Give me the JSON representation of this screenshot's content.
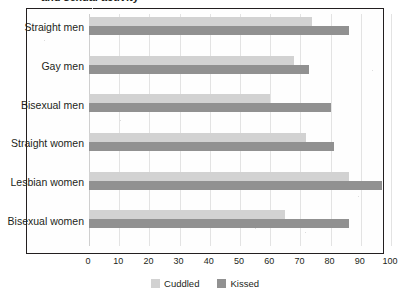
{
  "title": {
    "text": "and sexual activity",
    "cut_off": true
  },
  "legend": {
    "position": "bottom-center",
    "items": [
      {
        "label": "Cuddled",
        "color": "#d2d2d2",
        "swatch": "legend-swatch-cuddled"
      },
      {
        "label": "Kissed",
        "color": "#919191",
        "swatch": "legend-swatch-kissed"
      }
    ]
  },
  "axis": {
    "x_ticks": [
      "0",
      "10",
      "20",
      "30",
      "40",
      "50",
      "60",
      "70",
      "80",
      "90",
      "100"
    ],
    "y_categories": [
      "Straight men",
      "Gay men",
      "Bisexual men",
      "Straight women",
      "Lesbian women",
      "Bisexual women"
    ]
  },
  "chart_data": {
    "type": "bar",
    "orientation": "horizontal",
    "title": "and sexual activity",
    "xlabel": "",
    "ylabel": "",
    "xlim": [
      0,
      100
    ],
    "xtick_step": 10,
    "grid": "vertical",
    "legend_position": "bottom-center",
    "categories": [
      "Straight men",
      "Gay men",
      "Bisexual men",
      "Straight women",
      "Lesbian women",
      "Bisexual women"
    ],
    "series": [
      {
        "name": "Cuddled",
        "color": "#d2d2d2",
        "values": [
          74,
          68,
          60,
          72,
          86,
          65
        ]
      },
      {
        "name": "Kissed",
        "color": "#919191",
        "values": [
          86,
          73,
          80,
          81,
          97,
          86
        ]
      }
    ]
  }
}
